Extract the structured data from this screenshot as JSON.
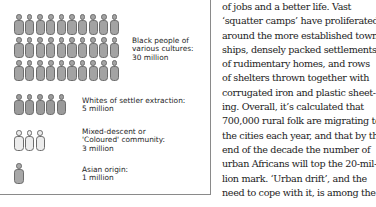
{
  "chart_data": {
    "type": "pictogram",
    "title": "",
    "unit": "1 figure = 1 million people",
    "categories": [
      "Black people of various cultures",
      "Whites of settler extraction",
      "Mixed-descent or 'Coloured' community",
      "Asian origin"
    ],
    "values": [
      30,
      5,
      3,
      1
    ],
    "value_unit": "million",
    "series_colors": [
      "#a3a3a3",
      "#9b9b9b",
      "#ececec",
      "#a8a8a8"
    ]
  },
  "groups": [
    {
      "id": "black",
      "count": 30,
      "per_row": 10,
      "fill": "#a3a3a3",
      "label_lines": [
        "Black people of",
        "various cultures:",
        "30 million"
      ]
    },
    {
      "id": "white",
      "count": 5,
      "per_row": 5,
      "fill": "#9b9b9b",
      "label_lines": [
        "Whites of settler extraction:",
        "5 million"
      ]
    },
    {
      "id": "coloured",
      "count": 3,
      "per_row": 3,
      "fill": "#ececec",
      "label_lines": [
        "Mixed-descent or",
        "'Coloured' community:",
        "3 million"
      ]
    },
    {
      "id": "asian",
      "count": 1,
      "per_row": 1,
      "fill": "#a8a8a8",
      "label_lines": [
        "Asian origin:",
        "1 million"
      ]
    }
  ],
  "article": {
    "lines": [
      "of jobs and a better life. Vast",
      "‘squatter camps’ have proliferated",
      "around the more established town-",
      "ships, densely packed settlements",
      "of rudimentary homes, and rows",
      "of shelters thrown together with",
      "corrugated iron and plastic sheet-",
      "ing. Overall, it’s calculated that",
      "700,000 rural folk are migrating to",
      "the cities each year, and that by the",
      "end of the decade the number of",
      "urban Africans will top the 20-mil-",
      "lion mark. ‘Urban drift’, and the",
      "need to cope with it, is among the"
    ]
  }
}
